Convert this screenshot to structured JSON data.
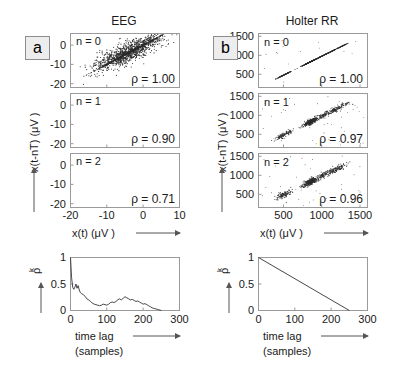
{
  "figure": {
    "panel_a_label": "a",
    "panel_b_label": "b",
    "column_titles": {
      "left": "EEG",
      "right": "Holter RR"
    }
  },
  "axes_labels": {
    "y_scatter": "x(t-nT)  (μV )",
    "x_scatter": "x(t)  (μV )",
    "y_corr": "ρ",
    "y_corr_sub": "k",
    "x_corr_line1": "time lag",
    "x_corr_line2": "(samples)"
  },
  "eeg": {
    "title": "EEG",
    "x_ticks": [
      "-20",
      "-10",
      "0",
      "10"
    ],
    "y_ticks": [
      "0",
      "-10",
      "-20"
    ],
    "xlim": [
      -20,
      10
    ],
    "ylim": [
      -22,
      6
    ],
    "panels": [
      {
        "n_label": "n = 0",
        "rho_label": "ρ = 1.00",
        "n": 0,
        "rho": 1.0
      },
      {
        "n_label": "n = 1",
        "rho_label": "ρ = 0.90",
        "n": 1,
        "rho": 0.9
      },
      {
        "n_label": "n = 2",
        "rho_label": "ρ = 0.71",
        "n": 2,
        "rho": 0.71
      }
    ]
  },
  "holter": {
    "title": "Holter RR",
    "x_ticks": [
      "500",
      "1000",
      "1500"
    ],
    "y_ticks": [
      "1500",
      "1000",
      "500"
    ],
    "xlim": [
      180,
      1600
    ],
    "ylim": [
      180,
      1600
    ],
    "panels": [
      {
        "n_label": "n = 0",
        "rho_label": "ρ = 1.00",
        "n": 0,
        "rho": 1.0
      },
      {
        "n_label": "n = 1",
        "rho_label": "ρ = 0.97",
        "n": 1,
        "rho": 0.97
      },
      {
        "n_label": "n = 2",
        "rho_label": "ρ = 0.96",
        "n": 2,
        "rho": 0.96
      }
    ]
  },
  "chart_data": [
    {
      "type": "scatter",
      "id": "eeg-n0",
      "title": "EEG n = 0",
      "xlabel": "x(t)  (μV )",
      "ylabel": "x(t-nT)  (μV )",
      "xlim": [
        -20,
        10
      ],
      "ylim": [
        -22,
        6
      ],
      "xticks": [
        -20,
        -10,
        0,
        10
      ],
      "yticks": [
        0,
        -10,
        -20
      ],
      "annotation": "ρ = 1.00",
      "note": "perfect identity line y = x",
      "grid": false
    },
    {
      "type": "scatter",
      "id": "eeg-n1",
      "title": "EEG n = 1",
      "xlim": [
        -20,
        10
      ],
      "ylim": [
        -22,
        6
      ],
      "xticks": [
        -20,
        -10,
        0,
        10
      ],
      "yticks": [
        0,
        -10,
        -20
      ],
      "annotation": "ρ = 0.90",
      "note": "elongated elliptical cloud along y = x, correlation 0.90",
      "grid": false
    },
    {
      "type": "scatter",
      "id": "eeg-n2",
      "title": "EEG n = 2",
      "xlim": [
        -20,
        10
      ],
      "ylim": [
        -22,
        6
      ],
      "xticks": [
        -20,
        -10,
        0,
        10
      ],
      "yticks": [
        0,
        -10,
        -20
      ],
      "annotation": "ρ = 0.71",
      "note": "broader elliptical cloud, correlation 0.71",
      "grid": false
    },
    {
      "type": "scatter",
      "id": "holter-n0",
      "title": "Holter RR n = 0",
      "xlim": [
        180,
        1600
      ],
      "ylim": [
        180,
        1600
      ],
      "xticks": [
        500,
        1000,
        1500
      ],
      "yticks": [
        500,
        1000,
        1500
      ],
      "annotation": "ρ = 1.00",
      "note": "clustered identity segments along y = x",
      "grid": false
    },
    {
      "type": "scatter",
      "id": "holter-n1",
      "title": "Holter RR n = 1",
      "xlim": [
        180,
        1600
      ],
      "ylim": [
        180,
        1600
      ],
      "xticks": [
        500,
        1000,
        1500
      ],
      "yticks": [
        500,
        1000,
        1500
      ],
      "annotation": "ρ = 0.97",
      "note": "clustered blobs near y = x with scatter, correlation 0.97",
      "grid": false
    },
    {
      "type": "scatter",
      "id": "holter-n2",
      "title": "Holter RR n = 2",
      "xlim": [
        180,
        1600
      ],
      "ylim": [
        180,
        1600
      ],
      "xticks": [
        500,
        1000,
        1500
      ],
      "yticks": [
        500,
        1000,
        1500
      ],
      "annotation": "ρ = 0.96",
      "note": "clustered blobs near y = x with scatter, correlation 0.96",
      "grid": false
    },
    {
      "type": "line",
      "id": "eeg-autocorrelation",
      "title": "EEG autocorrelation",
      "xlabel": "time lag (samples)",
      "ylabel": "ρk",
      "xlim": [
        0,
        300
      ],
      "ylim": [
        0,
        1
      ],
      "xticks": [
        0,
        100,
        200,
        300
      ],
      "yticks": [
        0,
        0.5,
        1
      ],
      "grid": false,
      "x": [
        0,
        3,
        6,
        9,
        12,
        15,
        18,
        21,
        24,
        27,
        30,
        35,
        40,
        45,
        50,
        55,
        60,
        65,
        70,
        75,
        80,
        85,
        90,
        95,
        100,
        105,
        110,
        115,
        120,
        125,
        130,
        135,
        140,
        145,
        150,
        155,
        160,
        165,
        170,
        175,
        180,
        185,
        190,
        195,
        200,
        205,
        210,
        215,
        220,
        225,
        230,
        235,
        240,
        245,
        250
      ],
      "y": [
        1.0,
        0.62,
        0.44,
        0.4,
        0.44,
        0.5,
        0.42,
        0.47,
        0.39,
        0.34,
        0.32,
        0.3,
        0.27,
        0.22,
        0.2,
        0.17,
        0.14,
        0.12,
        0.11,
        0.1,
        0.09,
        0.1,
        0.12,
        0.11,
        0.1,
        0.12,
        0.15,
        0.16,
        0.15,
        0.17,
        0.2,
        0.22,
        0.2,
        0.23,
        0.26,
        0.24,
        0.22,
        0.2,
        0.21,
        0.19,
        0.17,
        0.18,
        0.16,
        0.14,
        0.12,
        0.13,
        0.11,
        0.09,
        0.07,
        0.05,
        0.04,
        0.03,
        0.02,
        0.01,
        0.0
      ]
    },
    {
      "type": "line",
      "id": "holter-autocorrelation",
      "title": "Holter RR autocorrelation",
      "xlabel": "time lag (samples)",
      "ylabel": "ρk",
      "xlim": [
        0,
        300
      ],
      "ylim": [
        0,
        1
      ],
      "xticks": [
        0,
        100,
        200,
        300
      ],
      "yticks": [
        0,
        0.5,
        1
      ],
      "grid": false,
      "x": [
        0,
        250
      ],
      "y": [
        1.0,
        0.0
      ]
    }
  ],
  "corr_axes": {
    "x_ticks": [
      "0",
      "100",
      "200",
      "300"
    ],
    "y_ticks": [
      "1",
      "0.5",
      "0"
    ]
  }
}
